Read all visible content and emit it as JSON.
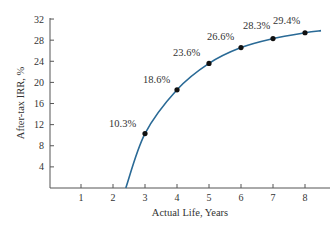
{
  "chart_data": {
    "type": "line",
    "title": "",
    "xlabel": "Actual Life, Years",
    "ylabel": "After-tax IRR, %",
    "xlim": [
      0,
      8.8
    ],
    "ylim": [
      0,
      32
    ],
    "x_ticks": [
      "1",
      "2",
      "3",
      "4",
      "5",
      "6",
      "7",
      "8"
    ],
    "y_ticks": [
      "4",
      "8",
      "12",
      "16",
      "20",
      "24",
      "28",
      "32"
    ],
    "grid": false,
    "legend": null,
    "series": [
      {
        "name": "After-tax IRR",
        "color": "#2a6a96",
        "curve_start": {
          "x": 2.4,
          "y": 0
        },
        "x": [
          3,
          4,
          5,
          6,
          7,
          8
        ],
        "values": [
          10.3,
          18.6,
          23.6,
          26.6,
          28.3,
          29.4
        ],
        "labels": [
          "10.3%",
          "18.6%",
          "23.6%",
          "26.6%",
          "28.3%",
          "29.4%"
        ]
      }
    ]
  },
  "colors": {
    "axis": "#555555",
    "curve": "#2a6a96",
    "marker": "#111111",
    "text": "#333333"
  }
}
